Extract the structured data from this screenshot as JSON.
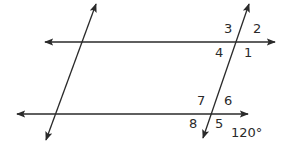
{
  "diagram": {
    "type": "parallel-lines-transversals",
    "colors": {
      "line": "#2a2a2a",
      "background": "#ffffff"
    },
    "lines": [
      {
        "id": "top-parallel",
        "x1": 45,
        "y1": 42,
        "x2": 275,
        "y2": 42,
        "arrows": "both"
      },
      {
        "id": "bottom-parallel",
        "x1": 17,
        "y1": 114,
        "x2": 248,
        "y2": 114,
        "arrows": "both"
      },
      {
        "id": "left-transversal",
        "x1": 96,
        "y1": 4,
        "x2": 46,
        "y2": 140,
        "arrows": "both"
      },
      {
        "id": "right-transversal",
        "x1": 249,
        "y1": 4,
        "x2": 203,
        "y2": 138,
        "arrows": "both"
      }
    ],
    "angle_labels": [
      {
        "text": "3",
        "x": 224,
        "y": 33
      },
      {
        "text": "2",
        "x": 253,
        "y": 33
      },
      {
        "text": "4",
        "x": 215,
        "y": 57
      },
      {
        "text": "1",
        "x": 244,
        "y": 57
      },
      {
        "text": "7",
        "x": 197,
        "y": 105
      },
      {
        "text": "6",
        "x": 224,
        "y": 105
      },
      {
        "text": "8",
        "x": 189,
        "y": 128
      },
      {
        "text": "5",
        "x": 215,
        "y": 128
      },
      {
        "text": "120°",
        "x": 231,
        "y": 137
      }
    ]
  }
}
